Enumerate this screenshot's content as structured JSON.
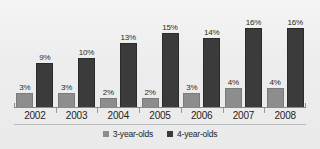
{
  "chart_data": {
    "type": "bar",
    "title": "",
    "subtitle": "",
    "xlabel": "",
    "ylabel": "",
    "grid": false,
    "legend_position": "bottom",
    "ylim": [
      0,
      18
    ],
    "value_suffix": "%",
    "categories": [
      "2002",
      "2003",
      "2004",
      "2005",
      "2006",
      "2007",
      "2008"
    ],
    "series": [
      {
        "name": "3-year-olds",
        "color": "#8d8d8d",
        "values": [
          3,
          3,
          2,
          2,
          3,
          4,
          4
        ],
        "labels": [
          "3%",
          "3%",
          "2%",
          "2%",
          "3%",
          "4%",
          "4%"
        ]
      },
      {
        "name": "4-year-olds",
        "color": "#3b3b3b",
        "values": [
          9,
          10,
          13,
          15,
          14,
          16,
          16
        ],
        "labels": [
          "9%",
          "10%",
          "13%",
          "15%",
          "14%",
          "16%",
          "16%"
        ]
      }
    ]
  }
}
